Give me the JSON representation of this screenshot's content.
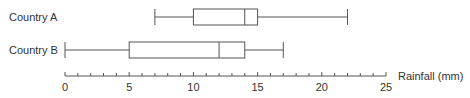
{
  "chart_data": {
    "type": "boxplot",
    "title": "",
    "xlabel": "Rainfall (mm)",
    "ylabel": "",
    "xlim": [
      0,
      25
    ],
    "x_ticks": [
      0,
      5,
      10,
      15,
      20,
      25
    ],
    "minor_tick_step": 1,
    "grid": false,
    "legend": null,
    "series": [
      {
        "name": "Country A",
        "min": 7,
        "q1": 10,
        "median": 14,
        "q3": 15,
        "max": 22
      },
      {
        "name": "Country B",
        "min": 0,
        "q1": 5,
        "median": 12,
        "q3": 14,
        "max": 17
      }
    ]
  },
  "colors": {
    "line": "#555555",
    "text": "#333333"
  }
}
